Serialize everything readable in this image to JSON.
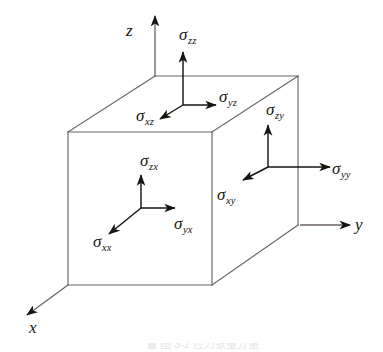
{
  "figure": {
    "type": "stress-tensor-cube-diagram",
    "background_color": "#ffffff",
    "edge_color": "#6b6460",
    "arrow_color": "#17150f",
    "text_color": "#17150f",
    "axes": [
      {
        "name": "z",
        "label": "z",
        "direction": "up"
      },
      {
        "name": "y",
        "label": "y",
        "direction": "right"
      },
      {
        "name": "x",
        "label": "x",
        "direction": "down-left"
      }
    ],
    "faces": [
      {
        "name": "top-face",
        "components": [
          {
            "name": "sigma-zz",
            "symbol": "σ",
            "subscript": "zz",
            "direction": "up"
          },
          {
            "name": "sigma-yz",
            "symbol": "σ",
            "subscript": "yz",
            "direction": "right"
          },
          {
            "name": "sigma-xz",
            "symbol": "σ",
            "subscript": "xz",
            "direction": "down-left"
          }
        ]
      },
      {
        "name": "front-face",
        "components": [
          {
            "name": "sigma-zx",
            "symbol": "σ",
            "subscript": "zx",
            "direction": "up"
          },
          {
            "name": "sigma-yx",
            "symbol": "σ",
            "subscript": "yx",
            "direction": "right"
          },
          {
            "name": "sigma-xx",
            "symbol": "σ",
            "subscript": "xx",
            "direction": "down-left"
          }
        ]
      },
      {
        "name": "right-face",
        "components": [
          {
            "name": "sigma-zy",
            "symbol": "σ",
            "subscript": "zy",
            "direction": "up"
          },
          {
            "name": "sigma-yy",
            "symbol": "σ",
            "subscript": "yy",
            "direction": "right"
          },
          {
            "name": "sigma-xy",
            "symbol": "σ",
            "subscript": "xy",
            "direction": "down-left"
          }
        ]
      }
    ]
  },
  "labels": {
    "axis_z": "z",
    "axis_y": "y",
    "axis_x": "x",
    "sigma_glyph": "σ",
    "sub_zz": "zz",
    "sub_yz": "yz",
    "sub_xz": "xz",
    "sub_zx": "zx",
    "sub_yx": "yx",
    "sub_xx": "xx",
    "sub_zy": "zy",
    "sub_yy": "yy",
    "sub_xy": "xy"
  },
  "caption": {
    "text": "图 3-2 应力张量分量"
  }
}
